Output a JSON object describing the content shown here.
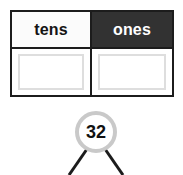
{
  "worksheet": {
    "background_color": "#ffffff",
    "place_value_table": {
      "border_color": "#1c1c1c",
      "columns": [
        {
          "header_label": "tens",
          "header_background": "#fbfbfb",
          "header_text_color": "#141414",
          "answer_value": "",
          "answer_box_border": "#dedede"
        },
        {
          "header_label": "ones",
          "header_background": "#323232",
          "header_text_color": "#ffffff",
          "answer_value": "",
          "answer_box_border": "#dedede"
        }
      ]
    },
    "number_bond": {
      "total_value": "32",
      "circle_stroke_color": "#c9c9c9",
      "circle_fill_color": "#ffffff",
      "value_text_color": "#111111",
      "branch_color": "#1c1c1c",
      "branch_count": "2"
    }
  }
}
